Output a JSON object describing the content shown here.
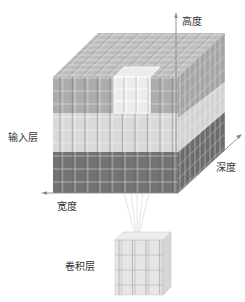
{
  "figure": {
    "labels": {
      "height": "高度",
      "depth": "深度",
      "width": "宽度",
      "input_layer": "输入层",
      "conv_layer": "卷积层"
    },
    "colors": {
      "top_face": "#b9b9b9",
      "upper_layer": "#aaaaaa",
      "middle_layer": "#d6d6d6",
      "lower_layer": "#707070",
      "highlight": "#e8e8e8",
      "axis": "#888888",
      "small_cube": "#e2e2e2"
    },
    "grid": {
      "columns": 10,
      "rows_per_layer": 3,
      "layers": 3,
      "depth": 9,
      "small_cube_size": 4
    }
  }
}
